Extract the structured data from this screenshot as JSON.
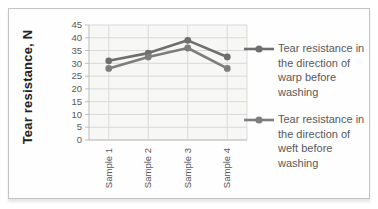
{
  "chart_data": {
    "type": "line",
    "title": "",
    "categories": [
      "Sample 1",
      "Sample 2",
      "Sample 3",
      "Sample 4"
    ],
    "series": [
      {
        "name": "Tear resistance in the direction of warp  before washing",
        "values": [
          31,
          34,
          39,
          32.5
        ],
        "color": "#6f6f6f"
      },
      {
        "name": "Tear resistance in the direction of weft  before washing",
        "values": [
          28,
          32.5,
          36,
          28
        ],
        "color": "#7d7d7d"
      }
    ],
    "xlabel": "",
    "ylabel": "Tear resistance, N",
    "ylim": [
      0,
      45
    ],
    "ytick_step": 5,
    "yticks": [
      "0",
      "5",
      "10",
      "15",
      "20",
      "25",
      "30",
      "35",
      "40",
      "45"
    ],
    "grid": true,
    "legend_position": "right",
    "colors": {
      "gridline": "#d9d9d9",
      "axis_line": "#bfbfbf",
      "tick_text": "#595959",
      "frame_border": "#c3c3c3"
    }
  }
}
